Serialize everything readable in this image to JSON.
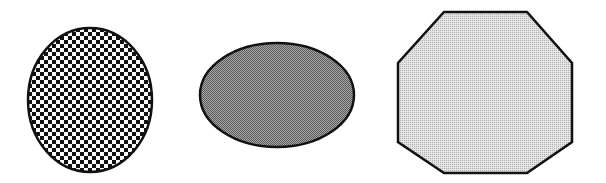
{
  "diagram": {
    "background": "#ffffff",
    "stroke_color": "#111111",
    "shapes": [
      {
        "id": "circle",
        "type": "circle",
        "fill_pattern": "checkered-squares",
        "fill_colors": [
          "#ffffff",
          "#111111"
        ],
        "cx": 90,
        "cy": 100,
        "rx": 62,
        "ry": 72
      },
      {
        "id": "ellipse",
        "type": "ellipse",
        "fill_pattern": "dense-dither-dark-gray",
        "fill_color": "#8a8a8a",
        "cx": 277,
        "cy": 95,
        "rx": 77,
        "ry": 52
      },
      {
        "id": "octagon",
        "type": "octagon",
        "fill_pattern": "fine-dither-light-gray",
        "fill_color": "#cfcfcf",
        "points": "444,12 527,12 572,63 572,142 527,173 444,173 398,142 398,63"
      }
    ]
  }
}
